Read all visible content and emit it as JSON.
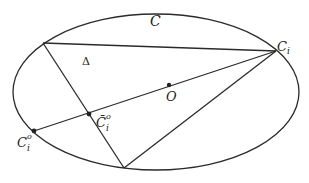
{
  "diagram": {
    "type": "geometry",
    "colors": {
      "stroke": "#2a2a2a",
      "text": "#222222",
      "background": "#ffffff"
    },
    "ellipse": {
      "cx": 156,
      "cy": 92,
      "rx": 143,
      "ry": 78,
      "label": "C"
    },
    "points": {
      "P_top_left": {
        "x": 43,
        "y": 43
      },
      "Ci": {
        "x": 276,
        "y": 51,
        "label": "C",
        "subscript": "i"
      },
      "P_bottom": {
        "x": 124,
        "y": 168
      },
      "O": {
        "x": 169,
        "y": 85,
        "label": "O"
      },
      "Ci_bar_o": {
        "x": 89,
        "y": 114,
        "label": "C̄",
        "subscript": "i",
        "superscript": "o"
      },
      "Ci_o": {
        "x": 34,
        "y": 131,
        "label": "C",
        "subscript": "i",
        "superscript": "o"
      }
    },
    "labels": {
      "curve": "C",
      "triangle": "Δ",
      "center": "O",
      "ci_main": "C",
      "ci_sub": "i",
      "cibar_main": "C̄",
      "cibar_sub": "i",
      "cibar_sup": "o",
      "cio_main": "C",
      "cio_sub": "i",
      "cio_sup": "o"
    }
  }
}
